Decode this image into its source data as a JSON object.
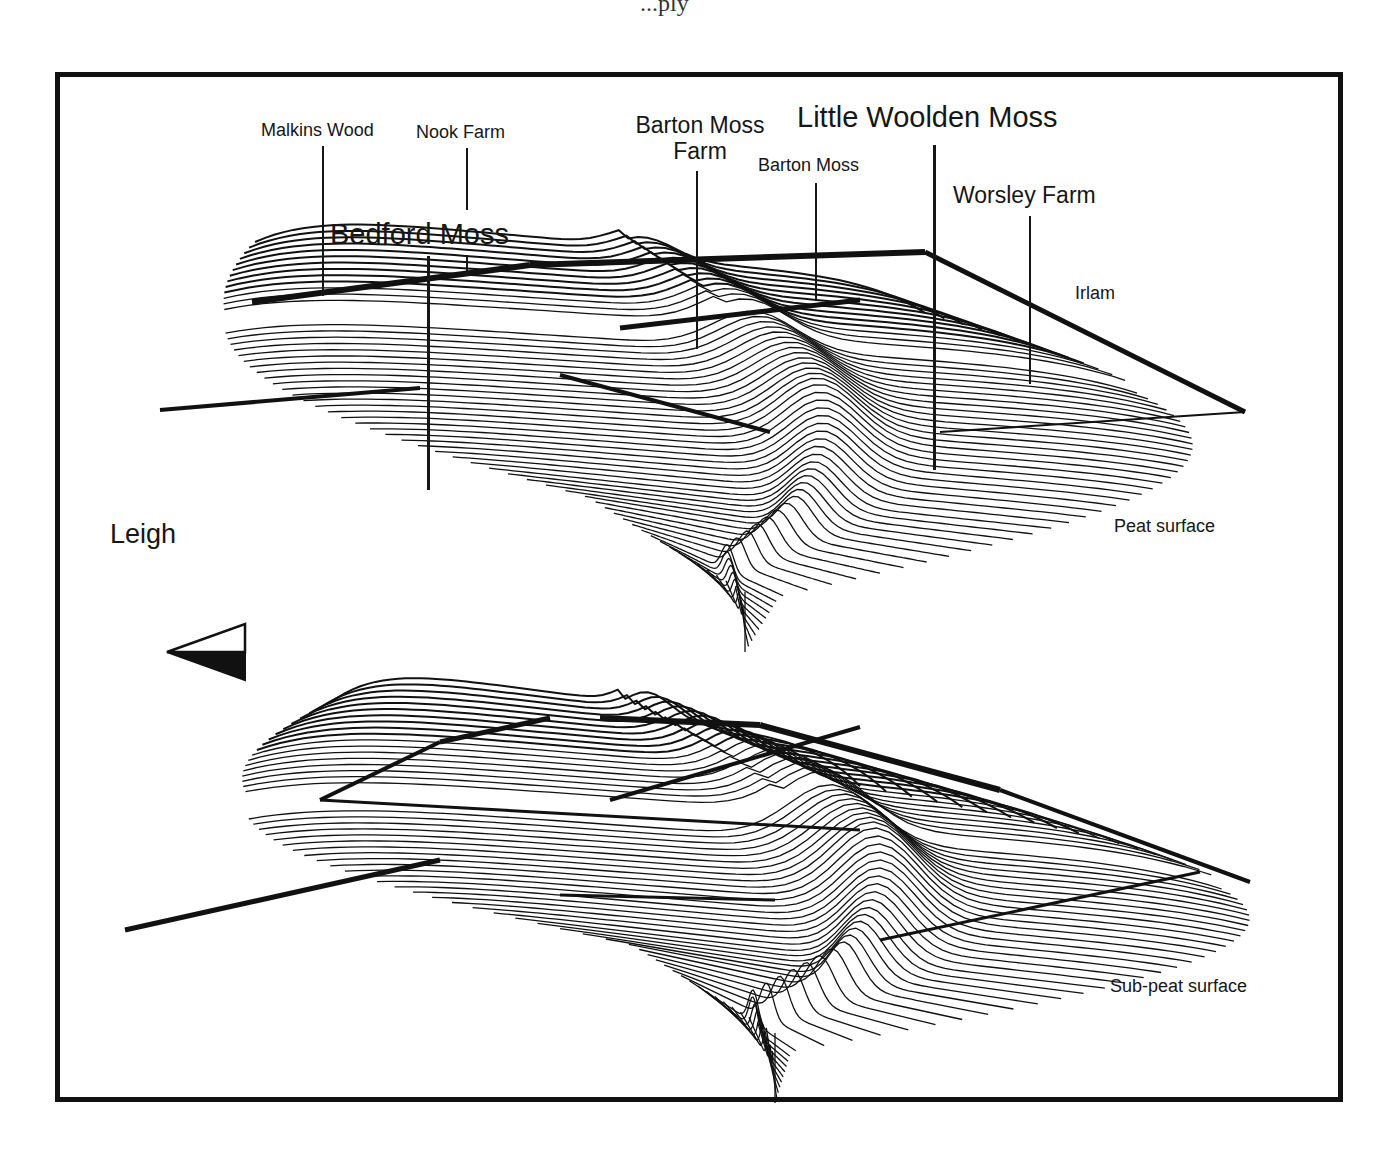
{
  "page_header_fragment": "...ply",
  "figure": {
    "border_color": "#111111",
    "labels": {
      "malkins_wood": "Malkins Wood",
      "nook_farm": "Nook Farm",
      "bedford_moss": "Bedford Moss",
      "barton_moss_farm_line1": "Barton Moss",
      "barton_moss_farm_line2": "Farm",
      "barton_moss": "Barton Moss",
      "little_woolden_moss": "Little Woolden Moss",
      "worsley_farm": "Worsley Farm",
      "irlam": "Irlam",
      "leigh": "Leigh"
    },
    "orientation_arrow": {
      "icon": "triangle-direction-arrow-icon",
      "points_to": "left",
      "upper_half": "white",
      "lower_half": "black"
    },
    "panels": [
      {
        "id": "peat",
        "caption": "Peat surface",
        "render": "wireframe-profile-lines",
        "line_count": 60,
        "line_color": "#111111"
      },
      {
        "id": "subpeat",
        "caption": "Sub-peat surface",
        "render": "wireframe-profile-lines",
        "line_count": 60,
        "line_color": "#111111"
      }
    ]
  }
}
